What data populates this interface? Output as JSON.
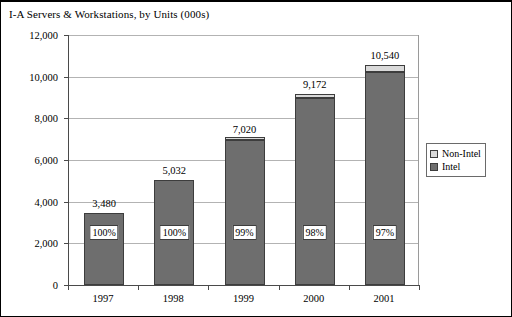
{
  "chart_title": "I-A Servers & Workstations, by Units (000s)",
  "legend": {
    "position": "right",
    "entries": [
      {
        "label": "Non-Intel",
        "color": "#d9d9d9",
        "swatch_name": "legend-swatch-non-intel"
      },
      {
        "label": "Intel",
        "color": "#6e6e6e",
        "swatch_name": "legend-swatch-intel"
      }
    ]
  },
  "chart_data": {
    "type": "bar",
    "subtype": "stacked-column",
    "title": "I-A Servers & Workstations, by Units (000s)",
    "xlabel": "",
    "ylabel": "",
    "categories": [
      "1997",
      "1998",
      "1999",
      "2000",
      "2001"
    ],
    "ylim": [
      0,
      12000
    ],
    "ytick_values": [
      0,
      2000,
      4000,
      6000,
      8000,
      10000,
      12000
    ],
    "ytick_labels": [
      "0",
      "2,000",
      "4,000",
      "6,000",
      "8,000",
      "10,000",
      "12,000"
    ],
    "grid": true,
    "grid_axis": "y",
    "legend_position": "right",
    "totals": [
      3480,
      5032,
      7020,
      9172,
      10540
    ],
    "total_labels": [
      "3,480",
      "5,032",
      "7,020",
      "9,172",
      "10,540"
    ],
    "intel_share_labels": [
      "100%",
      "100%",
      "99%",
      "98%",
      "97%"
    ],
    "intel_share_values": [
      100,
      100,
      99,
      98,
      97
    ],
    "series": [
      {
        "name": "Intel",
        "color": "#6e6e6e",
        "values": [
          3480,
          5032,
          6950,
          8989,
          10224
        ]
      },
      {
        "name": "Non-Intel",
        "color": "#d9d9d9",
        "values": [
          0,
          0,
          70,
          183,
          316
        ]
      }
    ]
  }
}
